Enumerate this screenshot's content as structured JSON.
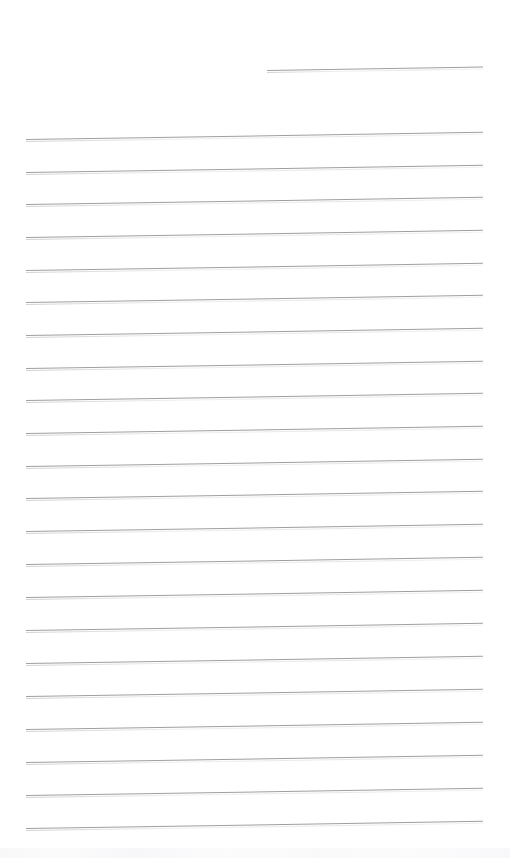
{
  "document": {
    "kind": "scanned-lined-paper",
    "title": "Blank ruled page",
    "page_width": 510,
    "page_height": 858,
    "background_color": "#ffffff",
    "rule_color": "#9a9a9a",
    "rule_thickness_px": 1,
    "skew_degrees": -0.9,
    "written_text": "",
    "total_rules": 22,
    "left_margin_x": 26,
    "right_margin_x": 483,
    "rule_spacing_px": 32.7
  },
  "rules": [
    {
      "id": "rule-1",
      "x": 267,
      "y": 70,
      "width": 216,
      "partial": true
    },
    {
      "id": "rule-2",
      "x": 26,
      "y": 139,
      "width": 457,
      "partial": false
    },
    {
      "id": "rule-3",
      "x": 26,
      "y": 172,
      "width": 457,
      "partial": false
    },
    {
      "id": "rule-4",
      "x": 26,
      "y": 204,
      "width": 457,
      "partial": false
    },
    {
      "id": "rule-5",
      "x": 26,
      "y": 237,
      "width": 457,
      "partial": false
    },
    {
      "id": "rule-6",
      "x": 26,
      "y": 270,
      "width": 457,
      "partial": false
    },
    {
      "id": "rule-7",
      "x": 26,
      "y": 302,
      "width": 457,
      "partial": false
    },
    {
      "id": "rule-8",
      "x": 26,
      "y": 335,
      "width": 457,
      "partial": false
    },
    {
      "id": "rule-9",
      "x": 26,
      "y": 368,
      "width": 457,
      "partial": false
    },
    {
      "id": "rule-10",
      "x": 26,
      "y": 400,
      "width": 457,
      "partial": false
    },
    {
      "id": "rule-11",
      "x": 26,
      "y": 433,
      "width": 457,
      "partial": false
    },
    {
      "id": "rule-12",
      "x": 26,
      "y": 466,
      "width": 457,
      "partial": false
    },
    {
      "id": "rule-13",
      "x": 26,
      "y": 498,
      "width": 457,
      "partial": false
    },
    {
      "id": "rule-14",
      "x": 26,
      "y": 531,
      "width": 457,
      "partial": false
    },
    {
      "id": "rule-15",
      "x": 26,
      "y": 564,
      "width": 457,
      "partial": false
    },
    {
      "id": "rule-16",
      "x": 26,
      "y": 597,
      "width": 457,
      "partial": false
    },
    {
      "id": "rule-17",
      "x": 26,
      "y": 630,
      "width": 457,
      "partial": false
    },
    {
      "id": "rule-18",
      "x": 26,
      "y": 663,
      "width": 457,
      "partial": false
    },
    {
      "id": "rule-19",
      "x": 26,
      "y": 696,
      "width": 457,
      "partial": false
    },
    {
      "id": "rule-20",
      "x": 26,
      "y": 729,
      "width": 457,
      "partial": false
    },
    {
      "id": "rule-21",
      "x": 26,
      "y": 762,
      "width": 457,
      "partial": false
    },
    {
      "id": "rule-22",
      "x": 26,
      "y": 795,
      "width": 457,
      "partial": false
    },
    {
      "id": "rule-23",
      "x": 26,
      "y": 828,
      "width": 457,
      "partial": false
    }
  ],
  "artifacts": {
    "bottom_noise_band_y": 848,
    "bottom_noise_band_height": 10
  }
}
